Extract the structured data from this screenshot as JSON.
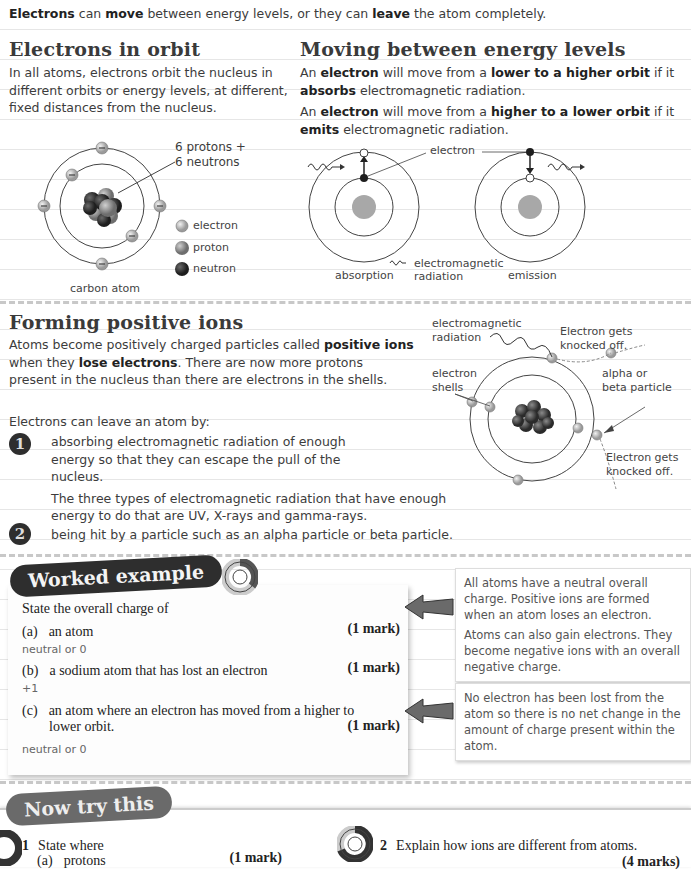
{
  "intro": {
    "parts": [
      {
        "text": "Electrons",
        "bold": true
      },
      {
        "text": " can ",
        "bold": false
      },
      {
        "text": "move",
        "bold": true
      },
      {
        "text": " between energy levels, or they can ",
        "bold": false
      },
      {
        "text": "leave",
        "bold": true
      },
      {
        "text": " the atom completely.",
        "bold": false
      }
    ]
  },
  "orbit_section": {
    "title": "Electrons in orbit",
    "body": "In all atoms, electrons orbit the nucleus in different orbits or energy levels, at different, fixed distances from the nucleus.",
    "diagram": {
      "nucleus_label": "6 protons + 6 neutrons",
      "nucleus_label_line1": "6 protons +",
      "nucleus_label_line2": "6 neutrons",
      "caption": "carbon atom",
      "legend": [
        {
          "icon": "electron-icon",
          "label": "electron"
        },
        {
          "icon": "proton-icon",
          "label": "proton"
        },
        {
          "icon": "neutron-icon",
          "label": "neutron"
        }
      ]
    }
  },
  "levels_section": {
    "title": "Moving between energy levels",
    "para1": {
      "p1": "An ",
      "b1": "electron",
      "p2": " will move from a ",
      "b2": "lower to a higher orbit",
      "p3": " if it ",
      "b3": "absorbs",
      "p4": " electromagnetic radiation."
    },
    "para2": {
      "p1": "An ",
      "b1": "electron",
      "p2": " will move from a ",
      "b2": "higher to a lower orbit",
      "p3": " if it ",
      "b3": "emits",
      "p4": " electromagnetic radiation."
    },
    "diagram": {
      "electron_label": "electron",
      "radiation_label_line1": "electromagnetic",
      "radiation_label_line2": "radiation",
      "absorption_caption": "absorption",
      "emission_caption": "emission"
    }
  },
  "ions_section": {
    "title": "Forming positive ions",
    "body": {
      "p1": "Atoms become positively charged particles called ",
      "b1": "positive ions",
      "p2": " when they ",
      "b2": "lose electrons",
      "p3": ". There are now more protons present in the nucleus than there are electrons in the shells."
    },
    "leave_intro": "Electrons can leave an atom by:",
    "steps": [
      {
        "number": "1",
        "text": "absorbing electromagnetic radiation of enough energy so that they can escape the pull of the nucleus.",
        "extra": "The three types of electromagnetic radiation that have enough energy to do that are UV, X-rays and gamma-rays."
      },
      {
        "number": "2",
        "text": "being hit by a particle such as an alpha particle or beta particle.",
        "extra": ""
      }
    ],
    "diagram": {
      "radiation_label_line1": "electromagnetic",
      "radiation_label_line2": "radiation",
      "knocked_off_top_line1": "Electron gets",
      "knocked_off_top_line2": "knocked off.",
      "shells_label_line1": "electron",
      "shells_label_line2": "shells",
      "particle_label_line1": "alpha or",
      "particle_label_line2": "beta particle",
      "knocked_off_bottom_line1": "Electron gets",
      "knocked_off_bottom_line2": "knocked off."
    }
  },
  "worked_example": {
    "banner": "Worked example",
    "prompt": "State the overall charge of",
    "questions": [
      {
        "label": "(a)",
        "text": "an atom",
        "text2": "",
        "marks": "(1 mark)",
        "answer": "neutral or 0"
      },
      {
        "label": "(b)",
        "text": "a sodium atom that has lost an electron",
        "text2": "",
        "marks": "(1 mark)",
        "answer": "+1"
      },
      {
        "label": "(c)",
        "text": "an atom where an electron has moved from a higher to",
        "text2": "lower orbit.",
        "marks": "(1 mark)",
        "answer": "neutral or 0"
      }
    ],
    "notes": [
      {
        "line1": "All atoms have a neutral overall charge. Positive ions are formed when an atom loses an electron.",
        "line2": "Atoms can also gain electrons. They become negative ions with an overall negative charge."
      },
      {
        "line1": "No electron has been lost from the atom so there is no net change in the amount of charge present within the atom.",
        "line2": ""
      }
    ]
  },
  "now_try": {
    "banner": "Now try this",
    "q1": {
      "number": "1",
      "text": "State where",
      "sub_label": "(a)",
      "sub_text": "protons",
      "marks": "(1 mark)"
    },
    "q2": {
      "number": "2",
      "text": "Explain how ions are different from atoms.",
      "marks": "(4 marks)"
    }
  },
  "colors": {
    "text": "#3a3a3a",
    "banner_dark": "#2e2e2e",
    "banner_gray": "#6a6a6a",
    "dash": "#c8c8c8",
    "nucleus_gray": "#a8a8a8"
  }
}
